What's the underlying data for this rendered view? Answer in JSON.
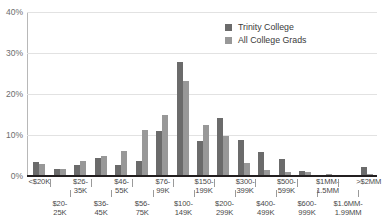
{
  "chart_data": {
    "type": "bar",
    "title": "",
    "subtitle": "",
    "xlabel": "",
    "ylabel": "",
    "ylim": [
      0,
      40
    ],
    "yticks": [
      0,
      10,
      20,
      30,
      40
    ],
    "ytick_labels": [
      "0%",
      "10%",
      "20%",
      "30%",
      "40%"
    ],
    "grid": true,
    "legend_position": "top-right",
    "categories": [
      "<$20K",
      "$20-\n25K",
      "$26-\n35K",
      "$36-\n45K",
      "$46-\n55K",
      "$56-\n75K",
      "$76-\n99K",
      "$100-\n149K",
      "$150-\n199K",
      "$200-\n299K",
      "$300-\n399K",
      "$400-\n499K",
      "$500-\n599K",
      "$600-\n999K",
      "$1MM-\n1.5MM",
      "$1.6MM-\n1.99MM",
      ">$2MM"
    ],
    "series": [
      {
        "name": "Trinity College",
        "color": "#6b6b6b",
        "values": [
          3.4,
          1.7,
          2.6,
          4.4,
          2.8,
          3.7,
          11.1,
          27.8,
          8.6,
          14.1,
          8.8,
          5.9,
          4.1,
          1.2,
          0.3,
          0.1,
          2.3
        ]
      },
      {
        "name": "All College Grads",
        "color": "#989898",
        "values": [
          2.9,
          1.8,
          3.6,
          4.8,
          6.1,
          11.2,
          14.8,
          23.1,
          12.4,
          9.7,
          3.1,
          1.5,
          1.1,
          1.1,
          0.6,
          0.2,
          0.4
        ]
      }
    ]
  },
  "legend": {
    "items": [
      {
        "label": "Trinity College",
        "color": "#6b6b6b"
      },
      {
        "label": "All College Grads",
        "color": "#989898"
      }
    ]
  },
  "colors": {
    "background": "#ffffff",
    "grid": "#e2e2e2",
    "baseline": "#231f20",
    "axis": "#b8b8b8",
    "tick_text": "#6d6d6d",
    "label_text": "#4a4a4a",
    "series_primary": "#6b6b6b",
    "series_secondary": "#989898"
  }
}
